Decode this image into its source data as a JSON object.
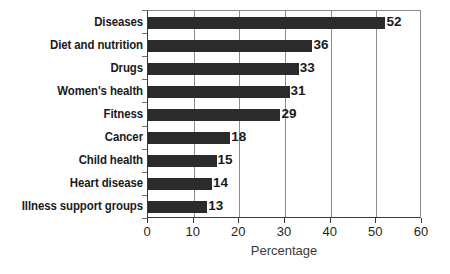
{
  "chart_data": {
    "type": "bar",
    "orientation": "horizontal",
    "title": "",
    "xlabel": "Percentage",
    "ylabel": "",
    "categories": [
      "Diseases",
      "Diet and nutrition",
      "Drugs",
      "Women's health",
      "Fitness",
      "Cancer",
      "Child health",
      "Heart disease",
      "Illness support groups"
    ],
    "values": [
      52,
      36,
      33,
      31,
      29,
      18,
      15,
      14,
      13
    ],
    "data_labels": [
      "52",
      "36",
      "33",
      "31",
      "29",
      "18",
      "15",
      "14",
      "13"
    ],
    "xlim": [
      0,
      60
    ],
    "xticks": [
      0,
      10,
      20,
      30,
      40,
      50,
      60
    ],
    "xticklabels": [
      "0",
      "10",
      "20",
      "30",
      "40",
      "50",
      "60"
    ],
    "grid": "vertical",
    "legend": "none",
    "colors": {
      "bar": "#2b2b2b",
      "gridline": "#8c8c8c",
      "axis": "#3a3a3a",
      "text": "#1a1a1a",
      "background": "#ffffff"
    }
  }
}
